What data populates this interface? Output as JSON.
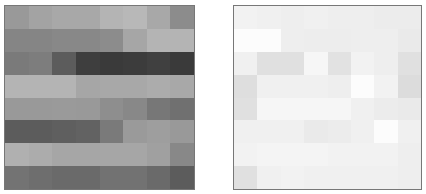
{
  "chart_data": [
    {
      "type": "heatmap",
      "title": "",
      "xlabel": "",
      "ylabel": "",
      "grid": false,
      "rows": 8,
      "cols": 8,
      "colormap": "grayscale",
      "values_hex": [
        [
          "#999999",
          "#a3a3a3",
          "#a8a8a8",
          "#a8a8a8",
          "#b4b4b4",
          "#b8b8b8",
          "#a8a8a8",
          "#8c8c8c"
        ],
        [
          "#858585",
          "#858585",
          "#888888",
          "#888888",
          "#8c8c8c",
          "#a6a6a6",
          "#b4b4b4",
          "#b4b4b4"
        ],
        [
          "#7a7a7a",
          "#7d7d7d",
          "#5c5c5c",
          "#3e3e3e",
          "#3a3a3a",
          "#3c3c3c",
          "#404040",
          "#3a3a3a"
        ],
        [
          "#b4b4b4",
          "#b4b4b4",
          "#b4b4b4",
          "#a6a6a6",
          "#a8a8a8",
          "#a8a8a8",
          "#acacac",
          "#a8a8a8"
        ],
        [
          "#999999",
          "#999999",
          "#9a9a9a",
          "#999999",
          "#8e8e8e",
          "#888888",
          "#777777",
          "#707070"
        ],
        [
          "#5c5c5c",
          "#5c5c5c",
          "#5f5f5f",
          "#626262",
          "#7a7a7a",
          "#9a9a9a",
          "#9e9e9e",
          "#999999"
        ],
        [
          "#b0b0b0",
          "#acacac",
          "#a6a6a6",
          "#a6a6a6",
          "#a6a6a6",
          "#a6a6a6",
          "#a0a0a0",
          "#888888"
        ],
        [
          "#737373",
          "#6e6e6e",
          "#6a6a6a",
          "#6a6a6a",
          "#727272",
          "#727272",
          "#6a6a6a",
          "#5c5c5c"
        ]
      ]
    },
    {
      "type": "heatmap",
      "title": "",
      "xlabel": "",
      "ylabel": "",
      "grid": false,
      "rows": 8,
      "cols": 8,
      "colormap": "grayscale",
      "values_hex": [
        [
          "#f2f2f2",
          "#f0f0f0",
          "#eeeeee",
          "#f0f0f0",
          "#eeeeee",
          "#eeeeee",
          "#ececec",
          "#ececec"
        ],
        [
          "#fcfcfc",
          "#fcfcfc",
          "#eeeeee",
          "#ededed",
          "#ededed",
          "#eeeeee",
          "#eeeeee",
          "#eaeaea"
        ],
        [
          "#f0f0f0",
          "#e0e0e0",
          "#e0e0e0",
          "#f6f6f6",
          "#e2e2e2",
          "#f2f2f2",
          "#eeeeee",
          "#e0e0e0"
        ],
        [
          "#dedede",
          "#f0f0f0",
          "#f0f0f0",
          "#f0f0f0",
          "#eeeeee",
          "#fcfcfc",
          "#f2f2f2",
          "#dcdcdc"
        ],
        [
          "#e0e0e0",
          "#f6f6f6",
          "#f6f6f6",
          "#f6f6f6",
          "#f6f6f6",
          "#f0f0f0",
          "#ececec",
          "#eaeaea"
        ],
        [
          "#f0f0f0",
          "#f0f0f0",
          "#f0f0f0",
          "#eaeaea",
          "#ececec",
          "#f0f0f0",
          "#fcfcfc",
          "#f0f0f0"
        ],
        [
          "#f2f2f2",
          "#f4f4f4",
          "#f4f4f4",
          "#f4f4f4",
          "#f2f2f2",
          "#f2f2f2",
          "#f2f2f2",
          "#eeeeee"
        ],
        [
          "#e0e0e0",
          "#f0f0f0",
          "#f2f2f2",
          "#f0f0f0",
          "#f0f0f0",
          "#f0f0f0",
          "#f0f0f0",
          "#eeeeee"
        ]
      ]
    }
  ]
}
